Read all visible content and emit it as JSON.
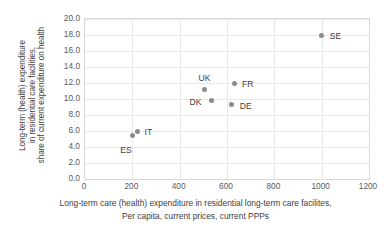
{
  "chart_data": {
    "type": "scatter",
    "title": "",
    "xlabel": "Long-term care (health) expenditure in residential long-term care facilites, Per capita, current prices, current PPPs",
    "xlabel_lines": [
      "Long-term care (health) expenditure in residential long-term care facilites,",
      "Per capita, current prices, current PPPs"
    ],
    "ylabel": "Long-term (health) expenditure in residential care facilities, share of current expenditure on health",
    "ylabel_lines": [
      "Long-term (health) expenditure",
      "in residential care facilities,",
      "share of current expenditure on health"
    ],
    "xlim": [
      0,
      1200
    ],
    "ylim": [
      0,
      20
    ],
    "xticks": [
      "0",
      "200",
      "400",
      "600",
      "800",
      "1000",
      "1200"
    ],
    "xtick_values": [
      0,
      200,
      400,
      600,
      800,
      1000,
      1200
    ],
    "yticks": [
      "0.0",
      "2.0",
      "4.0",
      "6.0",
      "8.0",
      "10.0",
      "12.0",
      "14.0",
      "16.0",
      "18.0",
      "20.0"
    ],
    "ytick_values": [
      0,
      2,
      4,
      6,
      8,
      10,
      12,
      14,
      16,
      18,
      20
    ],
    "grid": "horizontal-and-vertical",
    "legend": "none",
    "marker_color": "#8c8c8c",
    "gridline_color": "#e8e8e8",
    "points": [
      {
        "label": "ES",
        "x": 200,
        "y": 5.4,
        "label_dx": -12,
        "label_dy": 10
      },
      {
        "label": "IT",
        "x": 222,
        "y": 6.0,
        "label_dx": 7,
        "label_dy": -3
      },
      {
        "label": "UK",
        "x": 505,
        "y": 11.2,
        "label_dx": -6,
        "label_dy": -15
      },
      {
        "label": "DK",
        "x": 535,
        "y": 9.8,
        "label_dx": -22,
        "label_dy": -3
      },
      {
        "label": "DE",
        "x": 620,
        "y": 9.3,
        "label_dx": 8,
        "label_dy": -3
      },
      {
        "label": "FR",
        "x": 630,
        "y": 12.0,
        "label_dx": 8,
        "label_dy": -3
      },
      {
        "label": "SE",
        "x": 1000,
        "y": 18.0,
        "label_dx": 8,
        "label_dy": -3
      }
    ]
  }
}
